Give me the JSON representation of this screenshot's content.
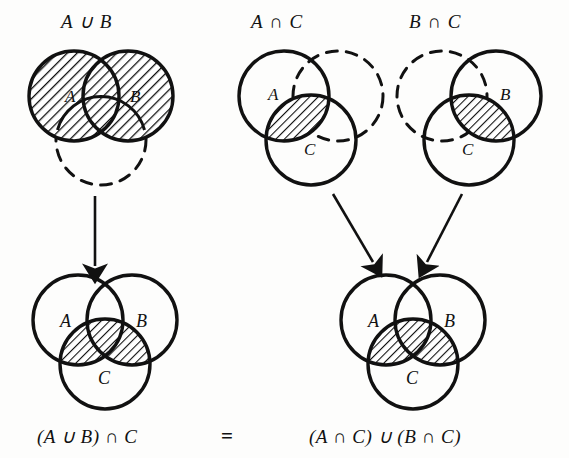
{
  "figure": {
    "kind": "venn-diagram-proof",
    "identity": "(A ∪ B) ∩ C = (A ∩ C) ∪ (B ∩ C)",
    "stroke_color": "#111111",
    "background_color": "#fdfdfc",
    "hatch_color": "#111111"
  },
  "titles": {
    "a_union_b": "A ∪ B",
    "a_inter_c": "A ∩ C",
    "b_inter_c": "B ∩ C"
  },
  "captions": {
    "left_result": "(A ∪ B) ∩ C",
    "equals": "=",
    "right_result": "(A ∩ C) ∪ (B ∩ C)"
  },
  "set_labels": {
    "a": "A",
    "b": "B",
    "c": "C"
  },
  "panels": [
    {
      "id": "top-left",
      "title_key": "a_union_b",
      "circles": [
        {
          "set": "A",
          "style": "solid",
          "labelled": true,
          "shaded": true
        },
        {
          "set": "B",
          "style": "solid",
          "labelled": true,
          "shaded": true
        },
        {
          "set": "C",
          "style": "dashed",
          "labelled": false,
          "shaded": false
        }
      ],
      "shaded_region": "A ∪ B"
    },
    {
      "id": "top-middle",
      "title_key": "a_inter_c",
      "circles": [
        {
          "set": "A",
          "style": "solid",
          "labelled": true,
          "shaded": false
        },
        {
          "set": "B",
          "style": "dashed",
          "labelled": false,
          "shaded": false
        },
        {
          "set": "C",
          "style": "solid",
          "labelled": true,
          "shaded": false
        }
      ],
      "shaded_region": "A ∩ C"
    },
    {
      "id": "top-right",
      "title_key": "b_inter_c",
      "circles": [
        {
          "set": "A",
          "style": "dashed",
          "labelled": false,
          "shaded": false
        },
        {
          "set": "B",
          "style": "solid",
          "labelled": true,
          "shaded": false
        },
        {
          "set": "C",
          "style": "solid",
          "labelled": true,
          "shaded": false
        }
      ],
      "shaded_region": "B ∩ C"
    },
    {
      "id": "bottom-left",
      "caption_key": "left_result",
      "circles": [
        {
          "set": "A",
          "style": "solid",
          "labelled": true,
          "shaded": false
        },
        {
          "set": "B",
          "style": "solid",
          "labelled": true,
          "shaded": false
        },
        {
          "set": "C",
          "style": "solid",
          "labelled": true,
          "shaded": false
        }
      ],
      "shaded_region": "(A ∪ B) ∩ C"
    },
    {
      "id": "bottom-right",
      "caption_key": "right_result",
      "circles": [
        {
          "set": "A",
          "style": "solid",
          "labelled": true,
          "shaded": false
        },
        {
          "set": "B",
          "style": "solid",
          "labelled": true,
          "shaded": false
        },
        {
          "set": "C",
          "style": "solid",
          "labelled": true,
          "shaded": false
        }
      ],
      "shaded_region": "(A ∩ C) ∪ (B ∩ C)"
    }
  ],
  "arrows": [
    {
      "id": "arrow-down-left",
      "from_panel": "top-left",
      "to_panel": "bottom-left",
      "direction": "down"
    },
    {
      "id": "arrow-diag-left",
      "from_panel": "top-middle",
      "to_panel": "bottom-right",
      "direction": "down-right"
    },
    {
      "id": "arrow-diag-right",
      "from_panel": "top-right",
      "to_panel": "bottom-right",
      "direction": "down-left"
    }
  ]
}
